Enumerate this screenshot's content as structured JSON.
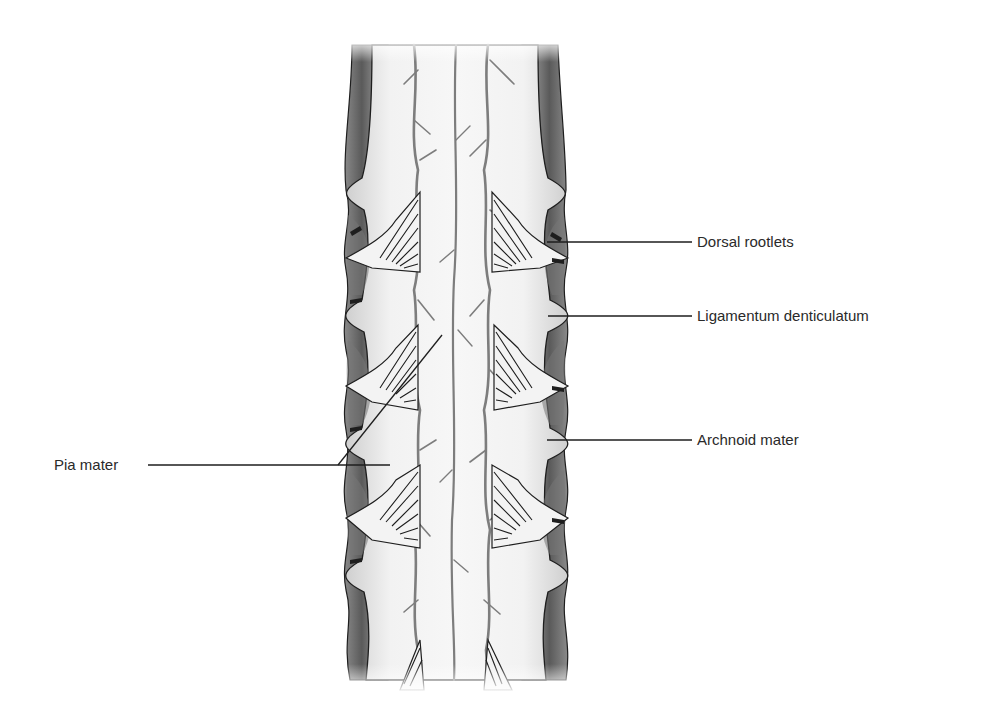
{
  "figure": {
    "labels": {
      "dorsal_rootlets": "Dorsal rootlets",
      "ligamentum_denticulatum": "Ligamentum denticulatum",
      "archnoid_mater": "Archnoid mater",
      "pia_mater": "Pia mater"
    }
  },
  "colors": {
    "background": "#ffffff",
    "dura_dark": "#6e6e6e",
    "cord_light": "#e9e9e9",
    "vessel": "#7d7d7d",
    "outline": "#1e1e1e",
    "label_text": "#2a2a2a"
  }
}
